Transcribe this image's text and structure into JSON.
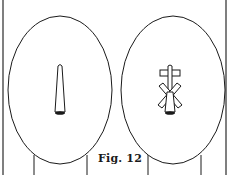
{
  "figure": {
    "caption": "Fig. 12",
    "panels": [
      {
        "name": "left-head",
        "element": "narrow tapered rod with dark base"
      },
      {
        "name": "right-head",
        "element": "rod with crossbar top and X-shaped crossed blades"
      }
    ],
    "colors": {
      "line": "#1a1a1a",
      "background": "#ffffff",
      "frame": "#555555"
    }
  }
}
